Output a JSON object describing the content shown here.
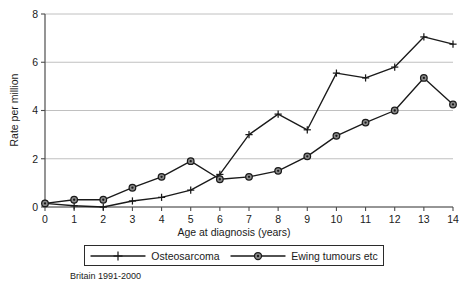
{
  "chart_data": {
    "type": "line",
    "title": "",
    "subtitle": "",
    "xlabel": "Age at diagnosis (years)",
    "ylabel": "Rate per million",
    "x": [
      0,
      1,
      2,
      3,
      4,
      5,
      6,
      7,
      8,
      9,
      10,
      11,
      12,
      13,
      14
    ],
    "xtick_labels": [
      "0",
      "1",
      "2",
      "3",
      "4",
      "5",
      "6",
      "7",
      "8",
      "9",
      "10",
      "11",
      "12",
      "13",
      "14"
    ],
    "ytick_labels": [
      "0",
      "2",
      "4",
      "6",
      "8"
    ],
    "yticks": [
      0,
      2,
      4,
      6,
      8
    ],
    "xlim": [
      0,
      14
    ],
    "ylim": [
      0,
      8
    ],
    "grid": "horizontal",
    "legend_position": "below-plot",
    "series": [
      {
        "name": "Osteosarcoma",
        "marker": "plus",
        "values": [
          0.15,
          0.05,
          0.0,
          0.25,
          0.4,
          0.7,
          1.35,
          3.0,
          3.85,
          3.2,
          5.55,
          5.35,
          5.8,
          7.05,
          6.75
        ]
      },
      {
        "name": "Ewing tumours etc",
        "marker": "circle",
        "values": [
          0.15,
          0.3,
          0.3,
          0.8,
          1.25,
          1.9,
          1.15,
          1.25,
          1.5,
          2.1,
          2.95,
          3.5,
          4.0,
          5.35,
          4.25
        ]
      }
    ],
    "annotations": [
      "Britain 1991-2000"
    ]
  },
  "legend": {
    "entries": [
      {
        "label": "Osteosarcoma"
      },
      {
        "label": "Ewing tumours etc"
      }
    ]
  },
  "caption": {
    "text": "Britain 1991-2000"
  },
  "colors": {
    "line": "#1a1a1a",
    "grid": "#b9b9b9",
    "axis": "#4d4d4d",
    "marker_fill": "#8a8a8a",
    "background": "#ffffff"
  }
}
